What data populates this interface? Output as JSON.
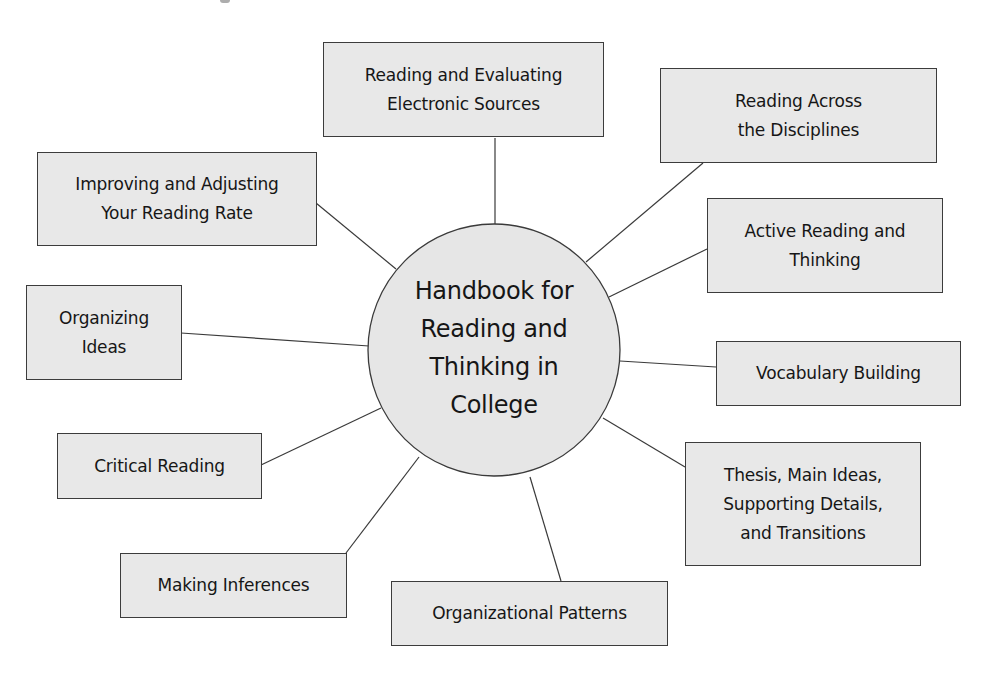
{
  "diagram": {
    "type": "concept-map",
    "colors": {
      "node_fill": "#e8e8e8",
      "hub_fill": "#e6e6e6",
      "stroke": "#3a3a3a",
      "text": "#161616",
      "background": "#ffffff"
    },
    "hub": {
      "label_lines": [
        "Handbook for",
        "Reading and",
        "Thinking in",
        "College"
      ]
    },
    "nodes": [
      {
        "id": "electronic-sources",
        "label_lines": [
          "Reading and Evaluating",
          "Electronic Sources"
        ]
      },
      {
        "id": "across-disciplines",
        "label_lines": [
          "Reading Across",
          "the Disciplines"
        ]
      },
      {
        "id": "reading-rate",
        "label_lines": [
          "Improving and Adjusting",
          "Your Reading Rate"
        ]
      },
      {
        "id": "active-reading",
        "label_lines": [
          "Active Reading and",
          "Thinking"
        ]
      },
      {
        "id": "organizing-ideas",
        "label_lines": [
          "Organizing",
          "Ideas"
        ]
      },
      {
        "id": "vocabulary",
        "label_lines": [
          "Vocabulary Building"
        ]
      },
      {
        "id": "critical-reading",
        "label_lines": [
          "Critical Reading"
        ]
      },
      {
        "id": "thesis-main-ideas",
        "label_lines": [
          "Thesis, Main Ideas,",
          "Supporting Details,",
          "and Transitions"
        ]
      },
      {
        "id": "making-inferences",
        "label_lines": [
          "Making Inferences"
        ]
      },
      {
        "id": "organizational-patterns",
        "label_lines": [
          "Organizational Patterns"
        ]
      }
    ],
    "edges": [
      {
        "from": "hub",
        "to": "electronic-sources"
      },
      {
        "from": "hub",
        "to": "across-disciplines"
      },
      {
        "from": "hub",
        "to": "reading-rate"
      },
      {
        "from": "hub",
        "to": "active-reading"
      },
      {
        "from": "hub",
        "to": "organizing-ideas"
      },
      {
        "from": "hub",
        "to": "vocabulary"
      },
      {
        "from": "hub",
        "to": "critical-reading"
      },
      {
        "from": "hub",
        "to": "thesis-main-ideas"
      },
      {
        "from": "hub",
        "to": "making-inferences"
      },
      {
        "from": "hub",
        "to": "organizational-patterns"
      }
    ]
  }
}
